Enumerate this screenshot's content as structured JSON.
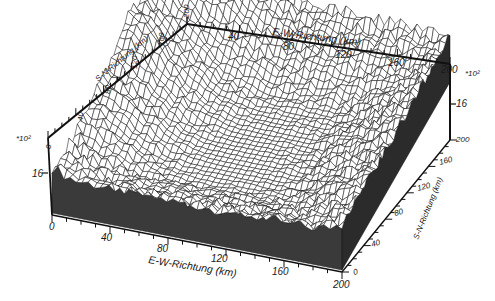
{
  "chart_data": {
    "type": "surface-3d-wireframe",
    "title": "",
    "x_axis": {
      "label": "E-W-Richtung  (km)",
      "range": [
        0,
        200
      ],
      "ticks": [
        "0",
        "40",
        "80",
        "120",
        "160",
        "200"
      ],
      "minor_tick_step": 10
    },
    "y_axis": {
      "label": "S-N-Richtung  (km)",
      "range": [
        0,
        200
      ],
      "ticks": [
        "0",
        "40",
        "80",
        "120",
        "160",
        "200"
      ],
      "minor_tick_step": 10
    },
    "z_axis": {
      "multiplier": "*10²",
      "ticks": [
        "0",
        "16"
      ],
      "right_ticks": [
        "16",
        "200"
      ]
    },
    "grid": "wireframe mesh",
    "legend": null
  },
  "labels": {
    "top_axis_title": "E-W-Richtung  (km)",
    "bottom_axis_title": "E-W-Richtung  (km)",
    "left_axis_title": "S-N-Richtung  (km)",
    "right_axis_title": "S-N-Richtung  (km)",
    "left_multiplier": "*10²",
    "right_multiplier": "*10²",
    "top_ticks": [
      "40",
      "80",
      "120",
      "160",
      "200"
    ],
    "bottom_ticks": [
      "0",
      "40",
      "80",
      "120",
      "160",
      "200"
    ],
    "left_sn_ticks": [
      "0",
      "40",
      "80",
      "120",
      "160",
      "200"
    ],
    "right_sn_ticks": [
      "0",
      "40",
      "80",
      "120",
      "160"
    ],
    "left_z_ticks": [
      "0",
      "16"
    ],
    "right_z_ticks": [
      "16",
      "200"
    ]
  }
}
